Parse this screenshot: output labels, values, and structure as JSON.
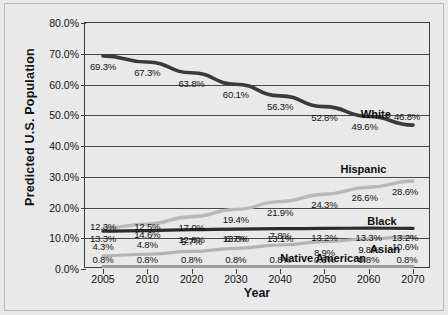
{
  "chart_data": {
    "type": "line",
    "title": "",
    "xlabel": "Year",
    "ylabel": "Predicted U.S. Population",
    "categories": [
      "2005",
      "2010",
      "2020",
      "2030",
      "2040",
      "2050",
      "2060",
      "2070"
    ],
    "ylim": [
      0,
      80
    ],
    "ytick_labels": [
      "0.0%",
      "10.0%",
      "20.0%",
      "30.0%",
      "40.0%",
      "50.0%",
      "60.0%",
      "70.0%",
      "80.0%"
    ],
    "ytick_values": [
      0,
      10,
      20,
      30,
      40,
      50,
      60,
      70,
      80
    ],
    "grid": true,
    "legend_position": "inline-right",
    "series": [
      {
        "name": "White",
        "color": "#3a3a3a",
        "width": 3.6,
        "values": [
          69.3,
          67.3,
          63.8,
          60.1,
          56.3,
          52.8,
          49.6,
          46.8
        ],
        "labels": [
          "69.3%",
          "67.3%",
          "63.8%",
          "60.1%",
          "56.3%",
          "52.8%",
          "49.6%",
          "46.8%"
        ]
      },
      {
        "name": "Hispanic",
        "color": "#b9b9b9",
        "width": 3.4,
        "values": [
          13.3,
          14.6,
          17.0,
          19.4,
          21.9,
          24.3,
          26.6,
          28.6
        ],
        "labels": [
          "13.3%",
          "14.6%",
          "17.0%",
          "19.4%",
          "21.9%",
          "24.3%",
          "26.6%",
          "28.6%"
        ]
      },
      {
        "name": "Black",
        "color": "#2b2b2b",
        "width": 3.2,
        "values": [
          12.3,
          12.5,
          12.8,
          13.0,
          13.1,
          13.2,
          13.3,
          13.2
        ],
        "labels": [
          "12.3%",
          "12.5%",
          "12.8%",
          "13.0%",
          "13.1%",
          "13.2%",
          "13.3%",
          "13.2%"
        ]
      },
      {
        "name": "Asian",
        "color": "#b4b4b4",
        "width": 3.2,
        "values": [
          4.3,
          4.8,
          5.7,
          6.7,
          7.8,
          8.9,
          9.8,
          10.6
        ],
        "labels": [
          "4.3%",
          "4.8%",
          "5.7%",
          "6.7%",
          "7.8%",
          "8.9%",
          "9.8%",
          "10.6%"
        ]
      },
      {
        "name": "Native American",
        "color": "#9e9e9e",
        "width": 3.0,
        "values": [
          0.8,
          0.8,
          0.8,
          0.8,
          0.8,
          0.8,
          0.8,
          0.8
        ],
        "labels": [
          "0.8%",
          "0.8%",
          "0.8%",
          "0.8%",
          "0.8%",
          "0.8%",
          "0.8%",
          "0.8%"
        ]
      }
    ]
  },
  "series_name_positions": [
    {
      "name": "White",
      "series": 0,
      "x": 88,
      "y": 50.5
    },
    {
      "name": "Hispanic",
      "series": 1,
      "x": 84,
      "y": 32.6
    },
    {
      "name": "Black",
      "series": 2,
      "x": 90,
      "y": 15.6
    },
    {
      "name": "Asian",
      "series": 3,
      "x": 91,
      "y": 6.6
    },
    {
      "name": "Native American",
      "series": 4,
      "x": 71,
      "y": 3.5
    }
  ],
  "label_offsets": {
    "White": [
      {
        "dx": 0,
        "dy": 10
      },
      {
        "dx": 0,
        "dy": 10
      },
      {
        "dx": 0,
        "dy": 10
      },
      {
        "dx": 0,
        "dy": 10
      },
      {
        "dx": 0,
        "dy": 10
      },
      {
        "dx": 0,
        "dy": 10
      },
      {
        "dx": -4,
        "dy": 10
      },
      {
        "dx": -6,
        "dy": -9
      }
    ],
    "Hispanic": [
      {
        "dx": 0,
        "dy": 10
      },
      {
        "dx": 0,
        "dy": 10
      },
      {
        "dx": 0,
        "dy": 10
      },
      {
        "dx": 0,
        "dy": 10
      },
      {
        "dx": 0,
        "dy": 10
      },
      {
        "dx": 0,
        "dy": 10
      },
      {
        "dx": -4,
        "dy": 10
      },
      {
        "dx": -8,
        "dy": 10
      }
    ],
    "Black": [
      {
        "dx": 0,
        "dy": -5
      },
      {
        "dx": 0,
        "dy": -5
      },
      {
        "dx": 0,
        "dy": 9
      },
      {
        "dx": 0,
        "dy": 9
      },
      {
        "dx": 0,
        "dy": 9
      },
      {
        "dx": 0,
        "dy": 9
      },
      {
        "dx": 0,
        "dy": 9
      },
      {
        "dx": -8,
        "dy": 9
      }
    ],
    "Asian": [
      {
        "dx": 0,
        "dy": -10
      },
      {
        "dx": 0,
        "dy": -10
      },
      {
        "dx": 0,
        "dy": -10
      },
      {
        "dx": 0,
        "dy": -10
      },
      {
        "dx": 0,
        "dy": -10
      },
      {
        "dx": 0,
        "dy": 10
      },
      {
        "dx": 0,
        "dy": 10
      },
      {
        "dx": -8,
        "dy": 10
      }
    ],
    "Native American": [
      {
        "dx": 0,
        "dy": -8
      },
      {
        "dx": 0,
        "dy": -8
      },
      {
        "dx": 0,
        "dy": -8
      },
      {
        "dx": 0,
        "dy": -8
      },
      {
        "dx": 0,
        "dy": -8
      },
      {
        "dx": 0,
        "dy": -8
      },
      {
        "dx": 0,
        "dy": -8
      },
      {
        "dx": -6,
        "dy": -8
      }
    ]
  }
}
